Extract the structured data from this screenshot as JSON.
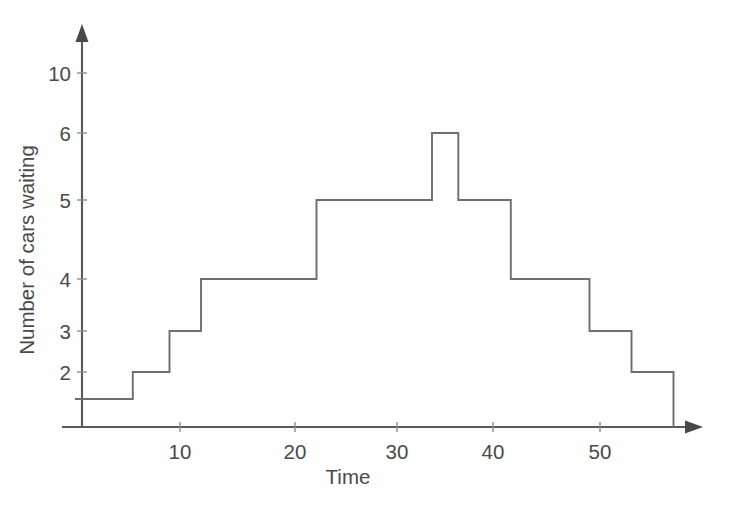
{
  "chart_data": {
    "type": "line",
    "subtype": "step-post",
    "title": "",
    "xlabel": "Time",
    "ylabel": "Number of cars waiting",
    "xlim": [
      0,
      62
    ],
    "ylim": [
      0,
      11
    ],
    "grid": false,
    "legend": null,
    "x_ticks": [
      10,
      20,
      30,
      40,
      50
    ],
    "x_tick_labels": [
      "10",
      "20",
      "30",
      "40",
      "50"
    ],
    "y_ticks": [
      2,
      3,
      4,
      5,
      6,
      10
    ],
    "y_tick_labels": [
      "2",
      "3",
      "4",
      "5",
      "6",
      "10"
    ],
    "y_axis_note": "non-uniform spacing as drawn",
    "x": [
      0,
      5.5,
      9,
      12,
      23,
      34,
      36.5,
      41.5,
      49,
      53,
      57
    ],
    "values": [
      1,
      2,
      3,
      4,
      5,
      6,
      5,
      4,
      3,
      2,
      0
    ],
    "steps": [
      {
        "x_start": 0,
        "x_end": 5.5,
        "value": 1
      },
      {
        "x_start": 5.5,
        "x_end": 9,
        "value": 2
      },
      {
        "x_start": 9,
        "x_end": 12,
        "value": 3
      },
      {
        "x_start": 12,
        "x_end": 23,
        "value": 4
      },
      {
        "x_start": 23,
        "x_end": 34,
        "value": 5
      },
      {
        "x_start": 34,
        "x_end": 36.5,
        "value": 6
      },
      {
        "x_start": 36.5,
        "x_end": 41.5,
        "value": 5
      },
      {
        "x_start": 41.5,
        "x_end": 49,
        "value": 4
      },
      {
        "x_start": 49,
        "x_end": 53,
        "value": 3
      },
      {
        "x_start": 53,
        "x_end": 57,
        "value": 2
      }
    ],
    "series_color": "#6e6e6e",
    "axis_color": "#595959",
    "background_color": "#fefefe"
  },
  "axes": {
    "y_title": "Number of cars waiting",
    "x_title": "Time"
  },
  "y_labels": {
    "v10": "10",
    "v6": "6",
    "v5": "5",
    "v4": "4",
    "v3": "3",
    "v2": "2"
  },
  "x_labels": {
    "t10": "10",
    "t20": "20",
    "t30": "30",
    "t40": "40",
    "t50": "50"
  }
}
